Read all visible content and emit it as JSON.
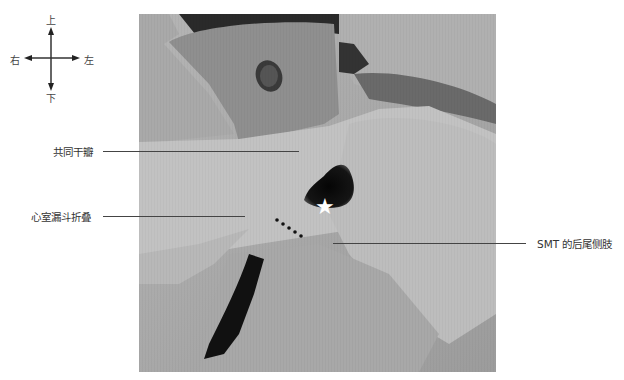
{
  "compass": {
    "up": "上",
    "down": "下",
    "left_side": "右",
    "right_side": "左"
  },
  "labels": {
    "common_trunk_valve": "共同干瓣",
    "ventricular_infundibular_fold": "心室漏斗折叠",
    "smt_posterior_limb": "SMT 的后尾侧肢"
  },
  "markers": {
    "star": "★"
  },
  "colors": {
    "leader_line": "#444444",
    "tissue_light": "#c8c8c8",
    "tissue_mid": "#a0a0a0",
    "cavity_dark": "#101010"
  }
}
